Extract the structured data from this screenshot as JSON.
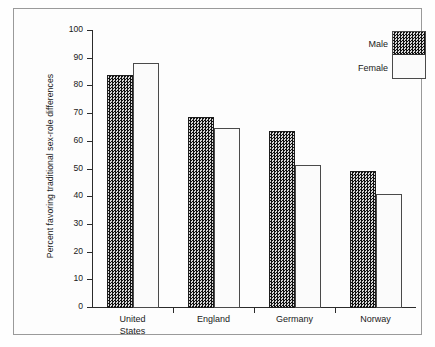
{
  "chart_data": {
    "type": "bar",
    "title": "",
    "xlabel": "",
    "ylabel": "Percent favoring traditional sex-role differences",
    "categories": [
      "United States",
      "England",
      "Germany",
      "Norway"
    ],
    "category_lines": [
      [
        "United",
        "States"
      ],
      [
        "England"
      ],
      [
        "Germany"
      ],
      [
        "Norway"
      ]
    ],
    "series": [
      {
        "name": "Male",
        "values": [
          84,
          69,
          64,
          49.5
        ]
      },
      {
        "name": "Female",
        "values": [
          88.5,
          65,
          51.5,
          41
        ]
      }
    ],
    "ylim": [
      0,
      100
    ],
    "yticks": [
      0,
      10,
      20,
      30,
      40,
      50,
      60,
      70,
      80,
      90,
      100
    ],
    "ytick_labels": [
      "0",
      "10",
      "20",
      "30",
      "40",
      "50",
      "60",
      "70",
      "80",
      "90",
      "100"
    ],
    "grid": false,
    "legend_position": "top-right",
    "colors": {
      "male_fill": "#3b3b3b",
      "female_fill": "#fbfbfb",
      "axis": "#2b2b2b",
      "frame": "#9a9a9a",
      "background": "#fdfdfd",
      "text": "#1a1a1a"
    }
  },
  "legend": {
    "male_label": "Male",
    "female_label": "Female"
  }
}
